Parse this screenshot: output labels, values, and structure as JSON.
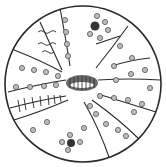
{
  "figure": {
    "type": "circular-sectioned-illustration",
    "background": "#ffffff",
    "stroke": "#2a2a2a",
    "fill_dark": "#555555",
    "center": [
      83,
      84
    ],
    "radius": 78
  },
  "regions": [
    {
      "name": "top-left-sector",
      "content": "wavy-lines"
    },
    {
      "name": "top-center-sector",
      "content": "ringed-dots"
    },
    {
      "name": "top-right-sector",
      "content": "ringed-dots-with-large-dark-dot"
    },
    {
      "name": "right-upper-sector",
      "content": "ringed-dots"
    },
    {
      "name": "left-band",
      "content": "ringed-dots"
    },
    {
      "name": "left-hatched-band",
      "content": "vertical-hatch-lines"
    },
    {
      "name": "center-nucleus",
      "content": "dark-striated-oval"
    },
    {
      "name": "right-bands",
      "content": "ringed-dots"
    },
    {
      "name": "bottom-region",
      "content": "scattered-ringed-dots"
    }
  ]
}
